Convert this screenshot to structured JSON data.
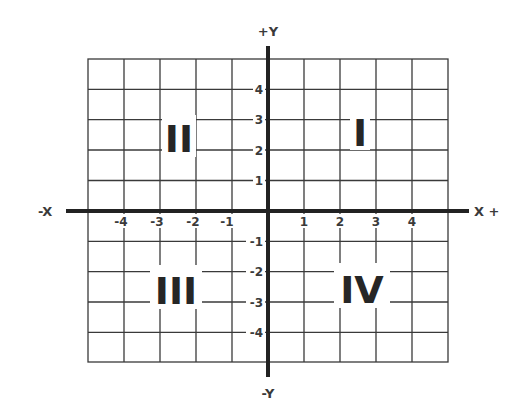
{
  "diagram": {
    "colors": {
      "background": "#ffffff",
      "grid_line": "#3a3a3a",
      "axis_line": "#222222",
      "text": "#3a3a3a",
      "quadrant_text": "#262626"
    },
    "axis_labels": {
      "pos_y": "+Y",
      "neg_y": "-Y",
      "neg_x": "-X",
      "pos_x": "X +"
    },
    "x_ticks": {
      "negative": [
        "-4",
        "-3",
        "-2",
        "-1"
      ],
      "positive": [
        "1",
        "2",
        "3",
        "4"
      ]
    },
    "y_ticks": {
      "positive": [
        "4",
        "3",
        "2",
        "1"
      ],
      "negative": [
        "-1",
        "-2",
        "-3",
        "-4"
      ]
    },
    "quadrants": {
      "q1": "I",
      "q2": "II",
      "q3": "III",
      "q4": "IV"
    },
    "grid": {
      "columns": 10,
      "rows": 10
    }
  }
}
